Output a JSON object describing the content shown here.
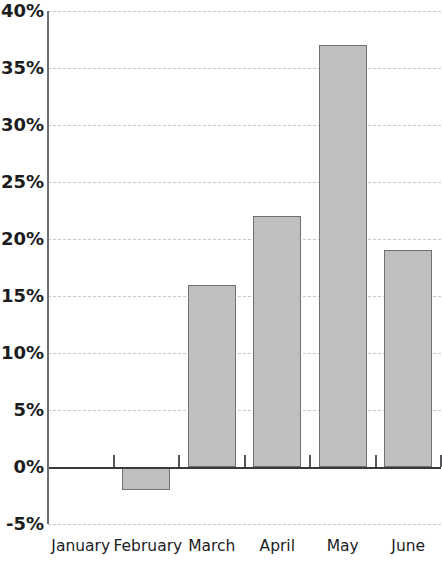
{
  "chart_data": {
    "type": "bar",
    "title": "",
    "subtitle": "",
    "xlabel": "",
    "ylabel": "",
    "categories": [
      "January",
      "February",
      "March",
      "April",
      "May",
      "June"
    ],
    "values": [
      0,
      -2,
      16,
      22,
      37,
      19
    ],
    "series": [
      {
        "name": "",
        "values": [
          0,
          -2,
          16,
          22,
          37,
          19
        ]
      }
    ],
    "ylim": [
      -5,
      40
    ],
    "ytick_values": [
      -5,
      0,
      5,
      10,
      15,
      20,
      25,
      30,
      35,
      40
    ],
    "ytick_labels": [
      "-5%",
      "0%",
      "5%",
      "10%",
      "15%",
      "20%",
      "25%",
      "30%",
      "35%",
      "40%"
    ],
    "value_format": "percent",
    "grid": true,
    "grid_axis": "y",
    "grid_style": "dashed",
    "legend": false,
    "legend_position": "none",
    "annotations": [],
    "colors": {
      "bar_fill": "#bfbfbf",
      "bar_stroke": "#707070",
      "gridline": "#c8c8cc",
      "zero_line": "#3a3a3a",
      "axis_line": "#6e6e73",
      "text": "#1c1c1e",
      "background": "#ffffff"
    }
  }
}
